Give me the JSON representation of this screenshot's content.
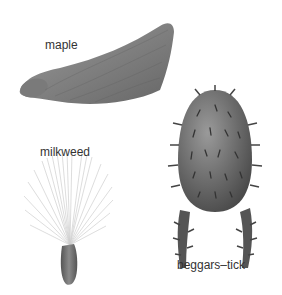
{
  "seeds": [
    {
      "id": "maple",
      "label": "maple"
    },
    {
      "id": "milkweed",
      "label": "milkweed"
    },
    {
      "id": "beggars-tick",
      "label": "beggars–tick"
    }
  ],
  "colors": {
    "seed_gray": "#6e6e6e",
    "fluff": "#d8d8d8",
    "background": "#ffffff"
  }
}
